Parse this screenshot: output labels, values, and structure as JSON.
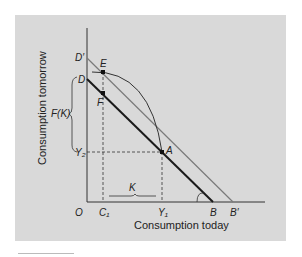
{
  "diagram": {
    "x_axis_title": "Consumption today",
    "y_axis_title": "Consumption tomorrow",
    "labels": {
      "origin": "O",
      "d_prime": "D′",
      "d": "D",
      "e": "E",
      "f": "F",
      "fk": "F(K)",
      "y2": "Y₂",
      "a": "A",
      "c1": "C₁",
      "y1": "Y₁",
      "b": "B",
      "b_prime": "B′",
      "k": "K"
    },
    "colors": {
      "background": "#d9d9d9",
      "budget_line_DB": "#1a1a1a",
      "budget_line_DpBp": "#7a7a7a",
      "curve": "#333333"
    }
  }
}
